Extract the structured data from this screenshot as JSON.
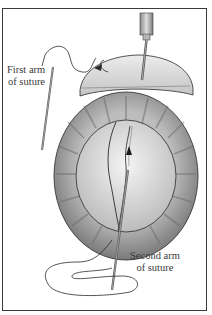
{
  "figure": {
    "labels": {
      "first_arm_line1": "First arm",
      "first_arm_line2": "of suture",
      "second_arm_line1": "Second arm",
      "second_arm_line2": "of suture"
    },
    "icons": {
      "needle_holder": "needle-holder-icon",
      "curved_needle": "curved-needle-icon",
      "direction_arrow": "arrow-icon",
      "eye": "eye-globe-icon"
    },
    "colors": {
      "frame_border": "#3a3a3a",
      "line": "#2a2a2a",
      "sclera_outer": "#8c8c8c",
      "cornea_inner": "#e6e6e6",
      "flap": "#d9d9d9",
      "background": "#ffffff"
    }
  }
}
